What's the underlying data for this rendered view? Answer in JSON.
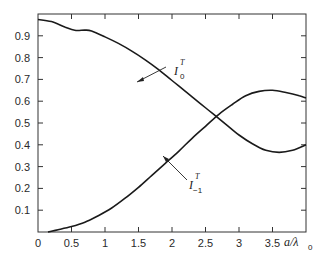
{
  "chart_data": {
    "type": "line",
    "title": "",
    "xlabel": "a/λ0",
    "ylabel": "",
    "xlim": [
      0,
      4
    ],
    "ylim": [
      0,
      1
    ],
    "grid": false,
    "legend": "none (curves labeled inline with arrows)",
    "x_ticks": [
      "0",
      "0.5",
      "1",
      "1.5",
      "2",
      "2.5",
      "3",
      "3.5"
    ],
    "y_ticks": [
      "0.1",
      "0.2",
      "0.3",
      "0.4",
      "0.5",
      "0.6",
      "0.7",
      "0.8",
      "0.9"
    ],
    "series": [
      {
        "name": "I_0^T",
        "label_main": "I",
        "label_sub": "0",
        "label_sup": "T",
        "x": [
          0.0,
          0.2,
          0.4,
          0.55,
          0.7,
          0.8,
          1.0,
          1.2,
          1.4,
          1.6,
          1.8,
          2.0,
          2.2,
          2.4,
          2.6,
          2.8,
          3.0,
          3.2,
          3.4,
          3.6,
          3.8,
          4.0
        ],
        "values": [
          0.975,
          0.965,
          0.94,
          0.925,
          0.926,
          0.922,
          0.895,
          0.865,
          0.83,
          0.79,
          0.745,
          0.695,
          0.645,
          0.595,
          0.545,
          0.495,
          0.445,
          0.405,
          0.375,
          0.365,
          0.375,
          0.4
        ]
      },
      {
        "name": "I_-1^T",
        "label_main": "I",
        "label_sub": "−1",
        "label_sup": "T",
        "x": [
          0.15,
          0.3,
          0.5,
          0.7,
          0.9,
          1.1,
          1.3,
          1.5,
          1.7,
          1.9,
          2.1,
          2.3,
          2.5,
          2.7,
          2.9,
          3.1,
          3.3,
          3.5,
          3.7,
          3.9,
          4.0
        ],
        "values": [
          0.0,
          0.01,
          0.025,
          0.045,
          0.075,
          0.11,
          0.155,
          0.205,
          0.26,
          0.315,
          0.37,
          0.43,
          0.485,
          0.54,
          0.585,
          0.625,
          0.645,
          0.65,
          0.64,
          0.625,
          0.615
        ]
      }
    ],
    "annotations": [
      {
        "text": "I_0^T",
        "points_to": {
          "x": 1.4,
          "y": 0.83
        }
      },
      {
        "text": "I_-1^T",
        "points_to": {
          "x": 1.85,
          "y": 0.34
        }
      }
    ]
  },
  "axes": {
    "x_label_main": "a/λ",
    "x_label_sub": "0"
  }
}
